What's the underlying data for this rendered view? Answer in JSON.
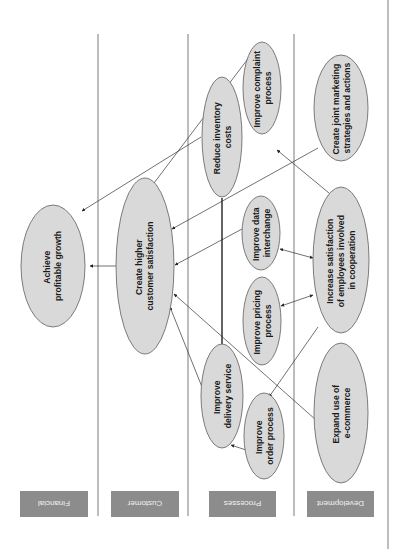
{
  "lanes": [
    {
      "id": "financial",
      "label": "Financial"
    },
    {
      "id": "customer",
      "label": "Customer"
    },
    {
      "id": "processes",
      "label": "Processes"
    },
    {
      "id": "development",
      "label": "Development"
    }
  ],
  "nodes": {
    "achieve_growth": {
      "lane": "financial",
      "line1": "Achieve",
      "line2": "profitable growth"
    },
    "customer_satisfaction": {
      "lane": "customer",
      "line1": "Create higher",
      "line2": "customer satisfaction"
    },
    "reduce_inventory": {
      "lane": "processes",
      "line1": "Reduce inventory",
      "line2": "costs"
    },
    "improve_complaint": {
      "lane": "processes",
      "line1": "Improve complaint",
      "line2": "process"
    },
    "improve_data": {
      "lane": "processes",
      "line1": "Improve data",
      "line2": "interchange"
    },
    "improve_pricing": {
      "lane": "processes",
      "line1": "Improve pricing",
      "line2": "process"
    },
    "improve_delivery": {
      "lane": "processes",
      "line1": "Improve",
      "line2": "delivery service"
    },
    "improve_order": {
      "lane": "processes",
      "line1": "Improve",
      "line2": "order process"
    },
    "joint_marketing": {
      "lane": "development",
      "line1": "Create joint marketing",
      "line2": "strategies and actions"
    },
    "employee_satisfaction": {
      "lane": "development",
      "line1": "Increase satisfaction",
      "line2": "of employees involved",
      "line3": "in cooperation"
    },
    "ecommerce": {
      "lane": "development",
      "line1": "Expand use of",
      "line2": "e-commerce"
    }
  },
  "edges": [
    {
      "from": "customer_satisfaction",
      "to": "achieve_growth"
    },
    {
      "from": "reduce_inventory",
      "to": "achieve_growth"
    },
    {
      "from": "improve_complaint",
      "to": "customer_satisfaction"
    },
    {
      "from": "joint_marketing",
      "to": "customer_satisfaction"
    },
    {
      "from": "improve_data",
      "to": "customer_satisfaction"
    },
    {
      "from": "ecommerce",
      "to": "customer_satisfaction"
    },
    {
      "from": "improve_delivery",
      "to": "customer_satisfaction"
    },
    {
      "from": "employee_satisfaction",
      "to": "improve_complaint"
    },
    {
      "from": "improve_complaint",
      "to": "employee_satisfaction"
    },
    {
      "from": "employee_satisfaction",
      "to": "improve_data",
      "bidirectional": true
    },
    {
      "from": "employee_satisfaction",
      "to": "improve_pricing",
      "bidirectional": true
    },
    {
      "from": "employee_satisfaction",
      "to": "improve_order"
    },
    {
      "from": "improve_order",
      "to": "improve_delivery"
    },
    {
      "from": "reduce_inventory",
      "to": "improve_delivery",
      "style": "thick-line"
    }
  ],
  "colors": {
    "node_fill": "#d9d9d9",
    "node_stroke": "#6e6e6e",
    "label_box": "#8c8c8c",
    "label_text": "#f2f2f2",
    "divider": "#7a7a7a"
  }
}
